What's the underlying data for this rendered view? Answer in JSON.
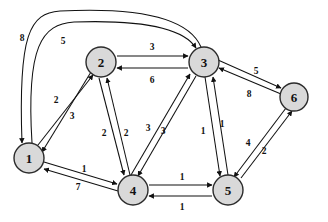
{
  "diagram": {
    "type": "directed-weighted-graph",
    "node_fill": "#d9d9d9",
    "node_stroke": "#2b2b2b",
    "edge_color": "#111111",
    "background": "#ffffff",
    "nodes": [
      {
        "id": "1",
        "label": "1",
        "cx": 29,
        "cy": 158,
        "r": 15
      },
      {
        "id": "2",
        "label": "2",
        "cx": 101,
        "cy": 62,
        "r": 15
      },
      {
        "id": "3",
        "label": "3",
        "cx": 204,
        "cy": 62,
        "r": 15
      },
      {
        "id": "4",
        "label": "4",
        "cx": 133,
        "cy": 190,
        "r": 15
      },
      {
        "id": "5",
        "label": "5",
        "cx": 228,
        "cy": 190,
        "r": 15
      },
      {
        "id": "6",
        "label": "6",
        "cx": 294,
        "cy": 97,
        "r": 14
      }
    ],
    "edges": [
      {
        "from": "3",
        "to": "1",
        "weight": "8",
        "shape": "curve-top-outer",
        "d": "M 201 47 C 186 12 120 8 60 11 C 30 13 18 34 22 143",
        "label_x": 22,
        "label_y": 38
      },
      {
        "from": "1",
        "to": "3",
        "weight": "5",
        "shape": "curve-top-inner",
        "d": "M 32 143 C 26 46 42 24 74 22 C 132 20 182 26 196 48",
        "label_x": 63,
        "label_y": 41
      },
      {
        "from": "1",
        "to": "2",
        "weight": "2",
        "shape": "straight",
        "d": "M 38 145 L 93 75",
        "label_x": 56,
        "label_y": 100
      },
      {
        "from": "2",
        "to": "1",
        "weight": "3",
        "shape": "straight",
        "d": "M 91 72 L 42 152",
        "label_x": 72,
        "label_y": 116
      },
      {
        "from": "2",
        "to": "3",
        "weight": "3",
        "shape": "straight",
        "d": "M 117 56 L 188 56",
        "label_x": 152,
        "label_y": 47
      },
      {
        "from": "3",
        "to": "2",
        "weight": "6",
        "shape": "straight",
        "d": "M 188 68 L 117 68",
        "label_x": 152,
        "label_y": 80
      },
      {
        "from": "2",
        "to": "4",
        "weight": "2",
        "shape": "straight",
        "d": "M 99 78 L 124 175",
        "label_x": 104,
        "label_y": 133
      },
      {
        "from": "4",
        "to": "2",
        "weight": "2",
        "shape": "straight",
        "d": "M 130 175 L 107 78",
        "label_x": 126,
        "label_y": 133
      },
      {
        "from": "4",
        "to": "3",
        "weight": "3",
        "shape": "straight",
        "d": "M 131 175 L 190 74",
        "label_x": 148,
        "label_y": 128
      },
      {
        "from": "3",
        "to": "4",
        "weight": "3",
        "shape": "straight",
        "d": "M 196 76 L 138 176",
        "label_x": 163,
        "label_y": 131
      },
      {
        "from": "3",
        "to": "5",
        "weight": "1",
        "shape": "straight",
        "d": "M 205 77 L 220 176",
        "label_x": 203,
        "label_y": 131
      },
      {
        "from": "5",
        "to": "3",
        "weight": "1",
        "shape": "straight",
        "d": "M 228 175 L 213 77",
        "label_x": 222,
        "label_y": 124
      },
      {
        "from": "1",
        "to": "4",
        "weight": "1",
        "shape": "straight",
        "d": "M 44 162 L 117 184",
        "label_x": 84,
        "label_y": 169
      },
      {
        "from": "4",
        "to": "1",
        "weight": "7",
        "shape": "straight",
        "d": "M 118 191 L 44 169",
        "label_x": 78,
        "label_y": 187
      },
      {
        "from": "4",
        "to": "5",
        "weight": "1",
        "shape": "straight",
        "d": "M 149 185 L 212 185",
        "label_x": 182,
        "label_y": 177
      },
      {
        "from": "5",
        "to": "4",
        "weight": "1",
        "shape": "straight",
        "d": "M 212 196 L 149 196",
        "label_x": 182,
        "label_y": 207
      },
      {
        "from": "3",
        "to": "6",
        "weight": "5",
        "shape": "straight",
        "d": "M 218 60 L 281 88",
        "label_x": 256,
        "label_y": 71
      },
      {
        "from": "6",
        "to": "3",
        "weight": "8",
        "shape": "straight",
        "d": "M 281 94 L 219 68",
        "label_x": 249,
        "label_y": 94
      },
      {
        "from": "6",
        "to": "5",
        "weight": "4",
        "shape": "straight",
        "d": "M 286 108 L 234 177",
        "label_x": 248,
        "label_y": 143
      },
      {
        "from": "5",
        "to": "6",
        "weight": "2",
        "shape": "straight",
        "d": "M 241 178 L 292 111",
        "label_x": 264,
        "label_y": 151
      }
    ]
  }
}
